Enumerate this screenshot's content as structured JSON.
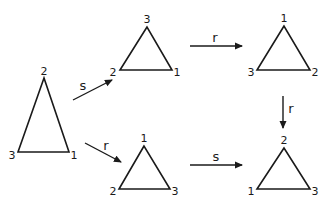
{
  "diagram": {
    "stroke_color": "#1a1a1a",
    "triangles": [
      {
        "id": "start",
        "apex": [
          44,
          78
        ],
        "bl": [
          18,
          152
        ],
        "br": [
          69,
          152
        ],
        "labels": {
          "top": "2",
          "left": "3",
          "right": "1"
        },
        "label_pos": {
          "top": [
            44,
            71
          ],
          "left": [
            12,
            155
          ],
          "right": [
            74,
            155
          ]
        }
      },
      {
        "id": "after-s",
        "apex": [
          147,
          27
        ],
        "bl": [
          120,
          70
        ],
        "br": [
          172,
          70
        ],
        "labels": {
          "top": "3",
          "left": "2",
          "right": "1"
        },
        "label_pos": {
          "top": [
            147,
            19
          ],
          "left": [
            113,
            72
          ],
          "right": [
            177,
            72
          ]
        }
      },
      {
        "id": "after-s-then-r",
        "apex": [
          284,
          26
        ],
        "bl": [
          257,
          70
        ],
        "br": [
          310,
          70
        ],
        "labels": {
          "top": "1",
          "left": "3",
          "right": "2"
        },
        "label_pos": {
          "top": [
            284,
            18
          ],
          "left": [
            251,
            72
          ],
          "right": [
            315,
            72
          ]
        }
      },
      {
        "id": "after-r",
        "apex": [
          144,
          146
        ],
        "bl": [
          119,
          189
        ],
        "br": [
          170,
          189
        ],
        "labels": {
          "top": "1",
          "left": "2",
          "right": "3"
        },
        "label_pos": {
          "top": [
            144,
            138
          ],
          "left": [
            113,
            191
          ],
          "right": [
            175,
            191
          ]
        }
      },
      {
        "id": "after-r-then-s",
        "apex": [
          284,
          148
        ],
        "bl": [
          257,
          189
        ],
        "br": [
          310,
          189
        ],
        "labels": {
          "top": "2",
          "left": "1",
          "right": "3"
        },
        "label_pos": {
          "top": [
            284,
            140
          ],
          "left": [
            251,
            191
          ],
          "right": [
            315,
            191
          ]
        }
      }
    ],
    "arrows": [
      {
        "id": "s-up",
        "label": "s",
        "from": [
          73,
          100
        ],
        "to": [
          112,
          80
        ],
        "label_pos": [
          83,
          85
        ]
      },
      {
        "id": "r-down",
        "label": "r",
        "from": [
          85,
          143
        ],
        "to": [
          121,
          162
        ],
        "label_pos": [
          106,
          145
        ]
      },
      {
        "id": "r-top",
        "label": "r",
        "from": [
          190,
          46
        ],
        "to": [
          242,
          46
        ],
        "label_pos": [
          215,
          37
        ]
      },
      {
        "id": "r-vertical",
        "label": "r",
        "from": [
          283,
          96
        ],
        "to": [
          283,
          128
        ],
        "label_pos": [
          291,
          108
        ]
      },
      {
        "id": "s-bottom",
        "label": "s",
        "from": [
          190,
          165
        ],
        "to": [
          242,
          165
        ],
        "label_pos": [
          216,
          156
        ]
      }
    ]
  }
}
